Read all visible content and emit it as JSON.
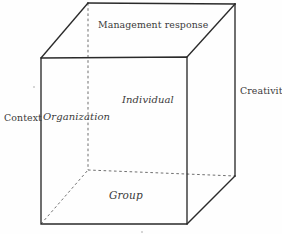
{
  "figure": {
    "background_color": "#fefefe",
    "line_color": "#2a2a2a",
    "dashed_line_color": "#6f6f6f",
    "text_color": "#3a3a3a",
    "width": 282,
    "height": 234
  },
  "labels": {
    "top_face": "Management response",
    "right_axis": "Creativity",
    "left_axis": "Context",
    "front_left": "Organization",
    "front_center": "Individual",
    "front_lower": "Group"
  },
  "geometry": {
    "front_face": {
      "top_left": [
        41,
        58
      ],
      "top_right": [
        187,
        57
      ],
      "bottom_right": [
        187,
        224
      ],
      "bottom_left": [
        41,
        224
      ]
    },
    "back_face": {
      "top_left": [
        88,
        3
      ],
      "top_right": [
        235,
        4
      ],
      "bottom_right": [
        235,
        176
      ],
      "bottom_left": [
        88,
        170
      ]
    },
    "solid_edges": [
      "front-rectangle",
      "front-top-left-to-back-top-left",
      "front-top-right-to-back-top-right",
      "front-bottom-right-to-back-bottom-right",
      "back-top-left-to-back-top-right",
      "back-top-right-to-back-bottom-right"
    ],
    "dashed_edges": [
      "back-top-left-to-back-bottom-left",
      "back-bottom-left-to-back-bottom-right",
      "front-bottom-left-to-back-bottom-left"
    ]
  }
}
